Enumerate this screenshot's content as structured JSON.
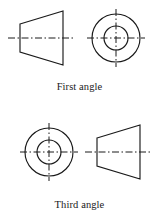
{
  "figure": {
    "background_color": "#ffffff",
    "line_color": "#1a1a1a",
    "stroke_width": 1.0,
    "centerline_dash": "7,2.5,1.5,2.5"
  },
  "panels": [
    {
      "id": "first-angle",
      "caption": "First angle",
      "caption_y": 88,
      "views": [
        {
          "id": "first-angle-cone-view",
          "type": "trapezoid",
          "description": "truncated cone side view, narrow end left",
          "left_x": 20,
          "right_x": 63,
          "center_y": 38,
          "left_half_height": 14,
          "right_half_height": 27,
          "centerline": {
            "x1": 8,
            "x2": 75,
            "y": 38
          }
        },
        {
          "id": "first-angle-circle-view",
          "type": "concentric-circles",
          "description": "end view, two concentric circles",
          "center_x": 116,
          "center_y": 38,
          "outer_radius": 24,
          "inner_radius": 12,
          "centerlines": {
            "horizontal": {
              "x1": 87,
              "x2": 145,
              "y": 38
            },
            "vertical": {
              "y1": 9,
              "y2": 67,
              "x": 116
            }
          }
        }
      ]
    },
    {
      "id": "third-angle",
      "caption": "Third angle",
      "caption_y": 206,
      "views": [
        {
          "id": "third-angle-circle-view",
          "type": "concentric-circles",
          "description": "end view, two concentric circles",
          "center_x": 49,
          "center_y": 152,
          "outer_radius": 24,
          "inner_radius": 12,
          "centerlines": {
            "horizontal": {
              "x1": 20,
              "x2": 78,
              "y": 152
            },
            "vertical": {
              "y1": 123,
              "y2": 181,
              "x": 49
            }
          }
        },
        {
          "id": "third-angle-cone-view",
          "type": "trapezoid",
          "description": "truncated cone side view, narrow end left",
          "left_x": 97,
          "right_x": 140,
          "center_y": 152,
          "left_half_height": 14,
          "right_half_height": 27,
          "centerline": {
            "x1": 85,
            "x2": 152,
            "y": 152
          }
        }
      ]
    }
  ]
}
